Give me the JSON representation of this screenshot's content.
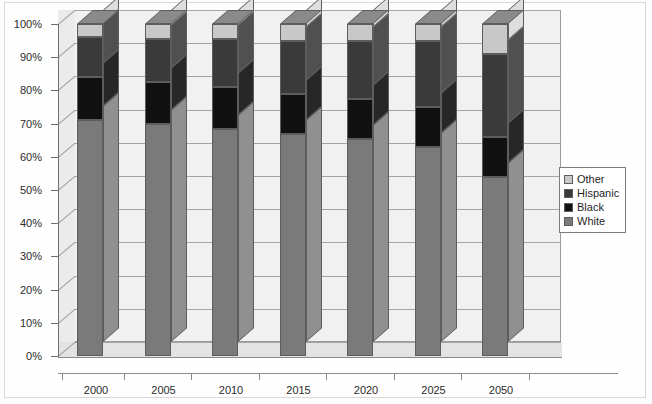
{
  "chart_data": {
    "type": "bar",
    "subtype": "stacked-100-percent-3d",
    "title": "",
    "xlabel": "",
    "ylabel": "",
    "categories": [
      "2000",
      "2005",
      "2010",
      "2015",
      "2020",
      "2025",
      "2050"
    ],
    "ylim": [
      0,
      100
    ],
    "ytick_labels": [
      "0%",
      "10%",
      "20%",
      "30%",
      "40%",
      "50%",
      "60%",
      "70%",
      "80%",
      "90%",
      "100%"
    ],
    "ytick_values": [
      0,
      10,
      20,
      30,
      40,
      50,
      60,
      70,
      80,
      90,
      100
    ],
    "grid": true,
    "legend_position": "right",
    "stack_order_bottom_to_top": [
      "White",
      "Black",
      "Hispanic",
      "Other"
    ],
    "series": [
      {
        "name": "White",
        "color": "#7a7a7a",
        "values": [
          71,
          70,
          68.5,
          67,
          65.5,
          63,
          54
        ]
      },
      {
        "name": "Black",
        "color": "#111111",
        "values": [
          13,
          12.5,
          12.5,
          12,
          12,
          12,
          12
        ]
      },
      {
        "name": "Hispanic",
        "color": "#3a3a3a",
        "values": [
          12,
          13,
          14.5,
          16,
          17.5,
          20,
          25
        ]
      },
      {
        "name": "Other",
        "color": "#c8c8c8",
        "values": [
          4,
          4.5,
          4.5,
          5,
          5,
          5,
          9
        ]
      }
    ],
    "cumulative_tops": {
      "White": [
        71,
        70,
        68.5,
        67,
        65.5,
        63,
        54
      ],
      "Black": [
        84,
        82.5,
        81,
        79,
        77.5,
        75,
        66
      ],
      "Hispanic": [
        96,
        95.5,
        95.5,
        95,
        95,
        95,
        91
      ],
      "Other": [
        100,
        100,
        100,
        100,
        100,
        100,
        100
      ]
    }
  },
  "legend": {
    "items": [
      {
        "label": "Other",
        "color": "#c8c8c8"
      },
      {
        "label": "Hispanic",
        "color": "#3a3a3a"
      },
      {
        "label": "Black",
        "color": "#111111"
      },
      {
        "label": "White",
        "color": "#7a7a7a"
      }
    ]
  },
  "colors": {
    "plot_background": "#f1f1f1",
    "floor": "#e3e3e3",
    "left_wall": "#ebebeb",
    "gridline": "#a5a5a5",
    "axis": "#6f6f6f",
    "outline": "#5d5d5d",
    "page_background": "#fdfdfd"
  }
}
